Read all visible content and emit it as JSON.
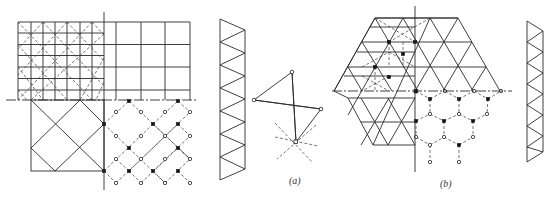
{
  "figure": {
    "labels": {
      "a": "(a)",
      "b": "(b)"
    },
    "colors": {
      "line": "#2a2a2a",
      "background": "#ffffff"
    },
    "panels": [
      {
        "id": "a",
        "description": "Square-on-square double-layer grid plan with truss elevation and pyramid joint detail"
      },
      {
        "id": "b",
        "description": "Triangular/hexagonal double-layer grid plan with truss elevation"
      }
    ]
  }
}
